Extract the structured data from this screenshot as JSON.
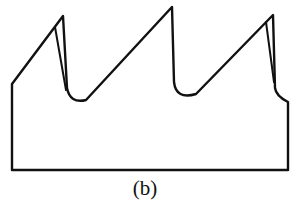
{
  "figure": {
    "caption": "(b)",
    "stroke_color": "#111111",
    "background_color": "#ffffff",
    "teeth_count": 3
  }
}
